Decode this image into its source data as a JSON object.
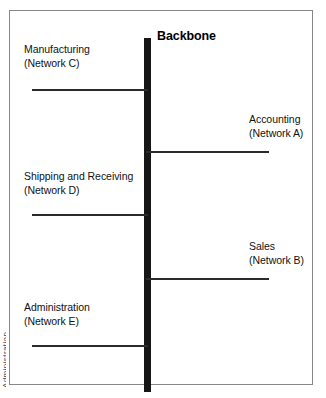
{
  "diagram": {
    "type": "network-backbone-topology",
    "backbone": {
      "title": "Backbone"
    },
    "segments": [
      {
        "id": "manufacturing",
        "name": "Manufacturing",
        "network": "(Network C)",
        "side": "left"
      },
      {
        "id": "accounting",
        "name": "Accounting",
        "network": "(Network A)",
        "side": "right"
      },
      {
        "id": "shipping-and-receiving",
        "name": "Shipping and Receiving",
        "network": "(Network D)",
        "side": "left"
      },
      {
        "id": "sales",
        "name": "Sales",
        "network": "(Network B)",
        "side": "right"
      },
      {
        "id": "administration",
        "name": "Administration",
        "network": "(Network E)",
        "side": "left"
      }
    ],
    "margin_artifact": "Administration"
  }
}
